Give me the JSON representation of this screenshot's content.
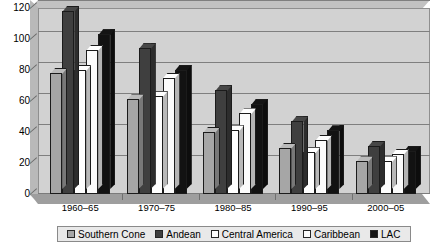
{
  "chart_data": {
    "type": "bar",
    "title": "",
    "subtitle": "",
    "xlabel": "",
    "ylabel": "",
    "ylim": [
      0,
      120
    ],
    "ytick_step": 20,
    "yticks": [
      0,
      20,
      40,
      60,
      80,
      100,
      120
    ],
    "grid": true,
    "legend_position": "bottom",
    "style": "3d-clustered-column",
    "categories": [
      "1960–65",
      "1970–75",
      "1980–85",
      "1990–95",
      "2000–05"
    ],
    "series": [
      {
        "name": "Southern Cone",
        "color": "#a6a6a6",
        "values": [
          78,
          61,
          40,
          30,
          21
        ]
      },
      {
        "name": "Andean",
        "color": "#3f3f3f",
        "values": [
          118,
          94,
          67,
          47,
          31
        ]
      },
      {
        "name": "Central America",
        "color": "#ffffff",
        "values": [
          80,
          63,
          41,
          27,
          21
        ]
      },
      {
        "name": "Caribbean",
        "color": "#fbfbfb",
        "values": [
          93,
          75,
          52,
          35,
          26
        ]
      },
      {
        "name": "LAC",
        "color": "#121212",
        "values": [
          103,
          80,
          58,
          41,
          28
        ]
      }
    ]
  },
  "legend": {
    "items": [
      {
        "label": "Southern Cone",
        "color": "#a6a6a6"
      },
      {
        "label": "Andean",
        "color": "#3f3f3f"
      },
      {
        "label": "Central America",
        "color": "#ffffff"
      },
      {
        "label": "Caribbean",
        "color": "#fbfbfb"
      },
      {
        "label": "LAC",
        "color": "#121212"
      }
    ]
  },
  "colors": {
    "plot_background": "#d2d2d2",
    "gridline": "#7f7f7f",
    "floor": "#9e9e9e",
    "axis_text": "#000000",
    "page_background": "#ffffff"
  }
}
